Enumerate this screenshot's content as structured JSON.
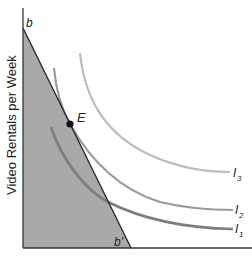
{
  "diagram": {
    "y_axis_label": "Video Rentals per Week",
    "x_axis_label": "",
    "budget_line": {
      "start_label": "b",
      "end_label": "b'"
    },
    "equilibrium_label": "E",
    "indifference_curves": [
      {
        "name": "I",
        "subscript": "1"
      },
      {
        "name": "I",
        "subscript": "2"
      },
      {
        "name": "I",
        "subscript": "3"
      }
    ],
    "colors": {
      "shaded_region": "#a9a9a9",
      "budget_line": "#222222",
      "I1": "#7d7d7d",
      "I2": "#9a9a9a",
      "I3": "#bcbcbc",
      "axis": "#333333"
    }
  }
}
